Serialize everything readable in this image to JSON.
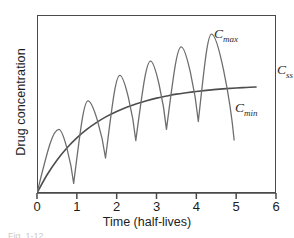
{
  "chart_data": {
    "type": "line",
    "title": "",
    "xlabel": "Time (half-lives)",
    "ylabel": "Drug concentration",
    "xlim": [
      0,
      6
    ],
    "ylim": [
      0,
      1.12
    ],
    "xticks": [
      0,
      1,
      2,
      3,
      4,
      5,
      6
    ],
    "xticklabels": [
      "0",
      "1",
      "2",
      "3",
      "4",
      "5",
      "6"
    ],
    "yticks": [],
    "yticklabels": [],
    "grid": false,
    "legend": "none",
    "annotations": [
      {
        "id": "cmax",
        "text": "C",
        "sub": "max",
        "x": 4.55,
        "y": 1.02
      },
      {
        "id": "css",
        "text": "C",
        "sub": "ss",
        "x": 6.1,
        "y": 0.7
      },
      {
        "id": "cmin",
        "text": "C",
        "sub": "min",
        "x": 5.0,
        "y": 0.4
      },
      {
        "id": "caption_fragment",
        "text": "Fig. 1-12"
      }
    ],
    "series": [
      {
        "name": "Css",
        "description": "smooth continuous-infusion accumulation curve approaching steady state",
        "style": "solid",
        "color": "#4d4d4d",
        "x": [
          0,
          0.25,
          0.5,
          0.75,
          1,
          1.25,
          1.5,
          1.75,
          2,
          2.25,
          2.5,
          2.75,
          3,
          3.25,
          3.5,
          3.75,
          4,
          4.25,
          4.5,
          4.75,
          5,
          5.25,
          5.5
        ],
        "y": [
          0,
          0.113,
          0.206,
          0.283,
          0.347,
          0.4,
          0.444,
          0.482,
          0.513,
          0.54,
          0.562,
          0.581,
          0.597,
          0.61,
          0.622,
          0.631,
          0.639,
          0.646,
          0.652,
          0.657,
          0.661,
          0.664,
          0.667
        ]
      },
      {
        "name": "Intermittent dosing",
        "description": "oscillating peak-trough profile from repeated doses, rounded peaks and sharp troughs",
        "style": "solid",
        "color": "#6e6e6e",
        "period": 0.72,
        "peaks_x": [
          0.55,
          1.28,
          2.08,
          2.85,
          3.62,
          4.38
        ],
        "peaks_y": [
          0.4,
          0.58,
          0.74,
          0.83,
          0.92,
          1.0
        ],
        "troughs_x": [
          0.92,
          1.72,
          2.48,
          3.25,
          4.05,
          4.95
        ],
        "troughs_y": [
          0.06,
          0.22,
          0.33,
          0.4,
          0.45,
          0.33
        ]
      }
    ]
  }
}
